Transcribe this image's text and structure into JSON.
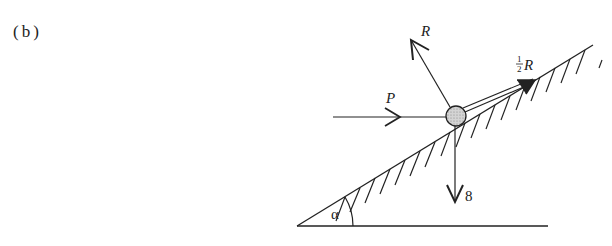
{
  "figure": {
    "part_label": "(b)",
    "forces": {
      "reaction": "R",
      "friction_numerator": "1",
      "friction_denominator": "2",
      "friction_symbol": "R",
      "push": "P",
      "weight": "8"
    },
    "angle_label": "α"
  },
  "colors": {
    "ink": "#222222",
    "particle_fill": "#c8c8c8"
  }
}
